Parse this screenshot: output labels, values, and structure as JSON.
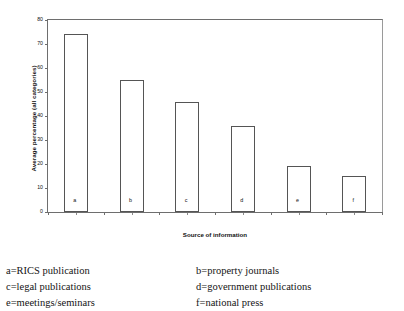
{
  "chart_data": {
    "type": "bar",
    "title": "",
    "xlabel": "Source of information",
    "ylabel": "Average percentage (all categories)",
    "categories": [
      "a",
      "b",
      "c",
      "d",
      "e",
      "f"
    ],
    "values": [
      74,
      55,
      46,
      36,
      19,
      15
    ],
    "ylim": [
      0,
      80
    ],
    "ytick_labels": [
      "0",
      "10",
      "20",
      "30",
      "40",
      "50",
      "60",
      "70",
      "80"
    ],
    "ytick_values": [
      0,
      10,
      20,
      30,
      40,
      50,
      60,
      70,
      80
    ],
    "grid": false,
    "legend_position": "below-plot",
    "bar_fill_color": "#ffffff",
    "bar_border_color": "#555555",
    "axis_color": "#6e6e6e",
    "series": [
      {
        "name": "Average percentage (all categories)",
        "values": [
          74,
          55,
          46,
          36,
          19,
          15
        ]
      }
    ]
  },
  "key": {
    "items": [
      {
        "label": "a=RICS publication"
      },
      {
        "label": "b=property journals"
      },
      {
        "label": "c=legal publications"
      },
      {
        "label": "d=government publications"
      },
      {
        "label": "e=meetings/seminars"
      },
      {
        "label": "f=national press"
      }
    ]
  }
}
